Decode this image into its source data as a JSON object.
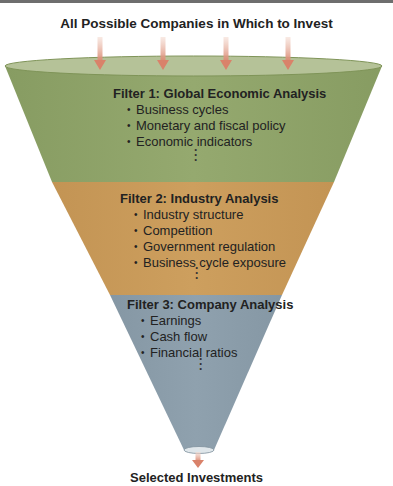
{
  "diagram": {
    "title": "All Possible Companies in Which to Invest",
    "caption": "Selected Investments",
    "colors": {
      "filter1": "#8fa469",
      "filter1_top": "#b5c298",
      "filter2": "#c99a59",
      "filter3": "#8b9daa",
      "arrow": "#d9826a"
    },
    "filters": [
      {
        "heading": "Filter 1: Global Economic Analysis",
        "items": [
          "Business cycles",
          "Monetary and fiscal policy",
          "Economic indicators"
        ],
        "ellipsis": "⋮"
      },
      {
        "heading": "Filter 2: Industry Analysis",
        "items": [
          "Industry structure",
          "Competition",
          "Government regulation",
          "Business cycle exposure"
        ],
        "ellipsis": "⋮"
      },
      {
        "heading": "Filter 3: Company Analysis",
        "items": [
          "Earnings",
          "Cash flow",
          "Financial ratios"
        ],
        "ellipsis": "⋮"
      }
    ]
  }
}
